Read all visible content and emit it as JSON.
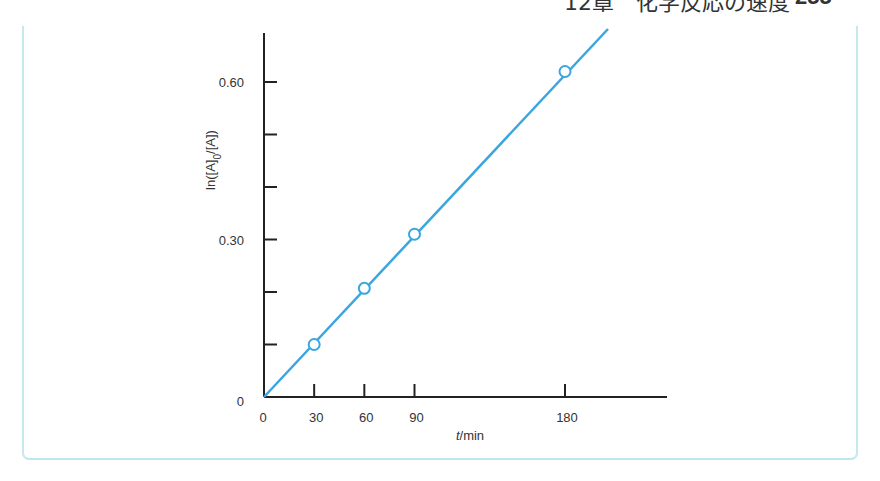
{
  "page_header": {
    "chapter": "12章　化学反応の速度",
    "page_number": "255"
  },
  "colors": {
    "line": "#3aa6e0",
    "axis": "#222222",
    "frame": "#c5e9ee",
    "text": "#333333"
  },
  "chart_data": {
    "type": "scatter",
    "title": "",
    "xlabel": "t/min",
    "xlabel_italic_part": "t",
    "xlabel_rest": "/min",
    "ylabel": "ln([A]0/[A])",
    "ylabel_parts": {
      "prefix": "ln([A]",
      "subscript": "0",
      "suffix": "/[A])"
    },
    "x_ticks": [
      0,
      30,
      60,
      90,
      180
    ],
    "x_tick_labels": [
      "0",
      "30",
      "60",
      "90",
      "180"
    ],
    "y_ticks": [
      0,
      0.1,
      0.2,
      0.3,
      0.4,
      0.5,
      0.6
    ],
    "y_tick_labels": [
      "0",
      "",
      "",
      "0.30",
      "",
      "",
      "0.60"
    ],
    "xlim": [
      0,
      240
    ],
    "ylim": [
      0,
      0.69
    ],
    "grid": false,
    "series": [
      {
        "name": "data",
        "marker": "open-circle",
        "x": [
          30,
          60,
          90,
          180
        ],
        "y": [
          0.1,
          0.207,
          0.31,
          0.62
        ]
      },
      {
        "name": "fit",
        "marker": "line",
        "x": [
          0,
          197
        ],
        "y": [
          0,
          0.7
        ]
      }
    ]
  }
}
